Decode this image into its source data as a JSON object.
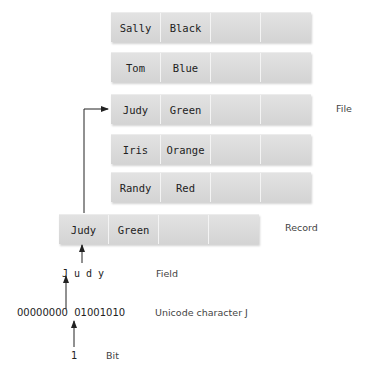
{
  "file": {
    "label": "File",
    "records": [
      {
        "fields": [
          "Sally",
          "Black",
          "",
          ""
        ]
      },
      {
        "fields": [
          "Tom",
          "Blue",
          "",
          ""
        ]
      },
      {
        "fields": [
          "Judy",
          "Green",
          "",
          ""
        ]
      },
      {
        "fields": [
          "Iris",
          "Orange",
          "",
          ""
        ]
      },
      {
        "fields": [
          "Randy",
          "Red",
          "",
          ""
        ]
      }
    ]
  },
  "record": {
    "label": "Record",
    "fields": [
      "Judy",
      "Green",
      "",
      ""
    ]
  },
  "field": {
    "label": "Field",
    "value": "J u d y"
  },
  "character": {
    "label": "Unicode character J",
    "bits": "00000000  01001010"
  },
  "bit": {
    "label": "Bit",
    "value": "1"
  },
  "colors": {
    "cell": "#dcdcdc",
    "line": "#222222"
  }
}
